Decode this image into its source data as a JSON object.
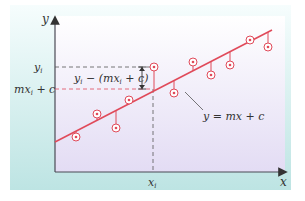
{
  "diagram": {
    "axes": {
      "x_label": "x",
      "y_label": "y"
    },
    "line_label": "y = mx + c",
    "tick_labels": {
      "x_i": "x",
      "x_i_sub": "i",
      "y_i": "y",
      "y_i_sub": "i",
      "fit_value": "mx",
      "fit_value_sub": "i",
      "fit_value_rest": " + c"
    },
    "residual_label": {
      "part1": "y",
      "part1_sub": "i",
      "part2": " − (mx",
      "part2_sub": "i",
      "part3": " + c)"
    },
    "colors": {
      "outer_panel_top": "#f4fcfc",
      "outer_panel_bottom": "#bfe5e4",
      "plot_top": "#ffffff",
      "plot_bottom": "#e4def4",
      "regression_line": "#e04a5a",
      "data_point": "#e04a5a",
      "axis": "#4a4a55",
      "dashed_guide": "#555555"
    },
    "regression_line": {
      "x1": 55,
      "y1": 142,
      "x2": 272,
      "y2": 30
    },
    "data_points": [
      {
        "x": 76,
        "y": 137,
        "above": false
      },
      {
        "x": 97,
        "y": 114,
        "above": true
      },
      {
        "x": 116,
        "y": 128,
        "above": false
      },
      {
        "x": 129,
        "y": 100,
        "above": true
      },
      {
        "x": 154,
        "y": 67,
        "above": true
      },
      {
        "x": 174,
        "y": 93,
        "above": false
      },
      {
        "x": 193,
        "y": 62,
        "above": true
      },
      {
        "x": 211,
        "y": 75,
        "above": false
      },
      {
        "x": 230,
        "y": 65,
        "above": false
      },
      {
        "x": 250,
        "y": 40,
        "above": true
      },
      {
        "x": 268,
        "y": 47,
        "above": false
      }
    ]
  }
}
